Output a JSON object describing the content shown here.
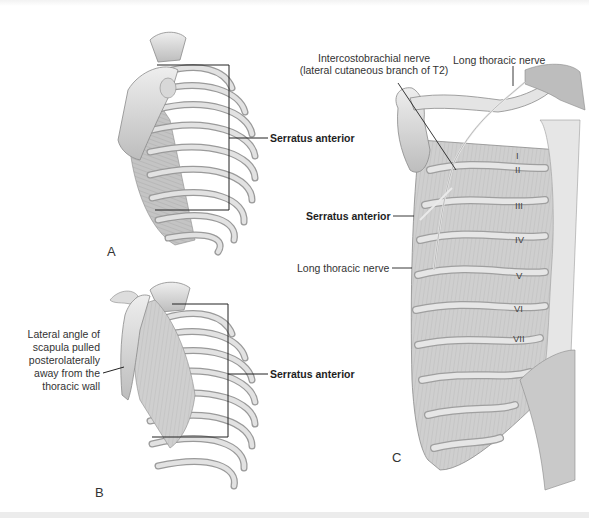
{
  "figure": {
    "panels": [
      {
        "id": "A",
        "label": "A",
        "callouts": [
          {
            "text": "Serratus anterior",
            "bold": true
          }
        ]
      },
      {
        "id": "B",
        "label": "B",
        "callouts": [
          {
            "text": "Serratus anterior",
            "bold": true
          },
          {
            "text": "Lateral angle of scapula pulled posterolaterally away from the thoracic wall",
            "lines": [
              "Lateral angle of",
              "scapula pulled",
              "posterolaterally",
              "away from the",
              "thoracic wall"
            ]
          }
        ]
      },
      {
        "id": "C",
        "label": "C",
        "callouts": [
          {
            "text": "Intercostobrachial nerve (lateral cutaneous branch of T2)",
            "lines": [
              "Intercostobrachial nerve",
              "(lateral cutaneous branch of T2)"
            ]
          },
          {
            "text": "Long thoracic nerve (top)"
          },
          {
            "text": "Serratus anterior",
            "bold": true
          },
          {
            "text": "Long thoracic nerve (side)"
          }
        ],
        "rib_numerals": [
          "I",
          "II",
          "III",
          "IV",
          "V",
          "VI",
          "VII"
        ]
      }
    ]
  },
  "labels": {
    "a_panel": "A",
    "b_panel": "B",
    "c_panel": "C",
    "a_serratus": "Serratus anterior",
    "b_serratus": "Serratus anterior",
    "b_lateral": [
      "Lateral angle of",
      "scapula pulled",
      "posterolaterally",
      "away from the",
      "thoracic wall"
    ],
    "c_intercosto": [
      "Intercostobrachial nerve",
      "(lateral cutaneous branch of T2)"
    ],
    "c_long_top": "Long thoracic nerve",
    "c_serratus": "Serratus anterior",
    "c_long_side": "Long thoracic nerve",
    "ribs": [
      "I",
      "II",
      "III",
      "IV",
      "V",
      "VI",
      "VII"
    ]
  },
  "colors": {
    "bone": "#e4e4e4",
    "bone_shade": "#b9b9b9",
    "muscle": "#c8c8c8",
    "outline": "#8a8a8a",
    "leader": "#222222"
  }
}
